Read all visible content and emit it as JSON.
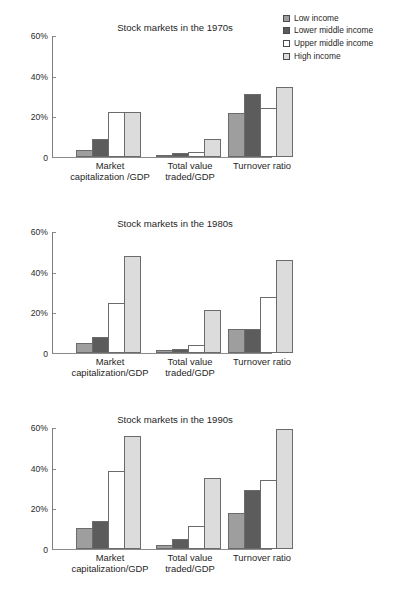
{
  "legend": {
    "position": "top-right",
    "items": [
      {
        "label": "Low income",
        "color": "#9e9e9e",
        "icon": "legend-swatch-icon"
      },
      {
        "label": "Lower middle income",
        "color": "#5c5c5c",
        "icon": "legend-swatch-icon"
      },
      {
        "label": "Upper middle income",
        "color": "#ffffff",
        "icon": "legend-swatch-icon"
      },
      {
        "label": "High income",
        "color": "#dcdcdc",
        "icon": "legend-swatch-icon"
      }
    ]
  },
  "chart_data": [
    {
      "type": "bar",
      "title": "Stock markets in the 1970s",
      "xlabel": "",
      "ylabel": "",
      "ylim": [
        0,
        60
      ],
      "yticks": [
        0,
        20,
        40,
        60
      ],
      "ytick_labels": [
        "0",
        "20%",
        "40%",
        "60%"
      ],
      "grid": false,
      "legend_position": "top-right",
      "categories": [
        "Market\ncapitalization /GDP",
        "Total value\ntraded/GDP",
        "Turnover ratio"
      ],
      "category_lines": [
        [
          "Market",
          "capitalization /GDP"
        ],
        [
          "Total value",
          "traded/GDP"
        ],
        [
          "Turnover ratio",
          ""
        ]
      ],
      "series": [
        {
          "name": "Low income",
          "values": [
            3.5,
            1.0,
            21.5
          ]
        },
        {
          "name": "Lower middle income",
          "values": [
            9.0,
            1.8,
            31.0
          ]
        },
        {
          "name": "Upper middle income",
          "values": [
            22.0,
            2.7,
            24.0
          ]
        },
        {
          "name": "High income",
          "values": [
            22.3,
            8.7,
            34.5
          ]
        }
      ]
    },
    {
      "type": "bar",
      "title": "Stock markets in the 1980s",
      "xlabel": "",
      "ylabel": "",
      "ylim": [
        0,
        60
      ],
      "yticks": [
        0,
        20,
        40,
        60
      ],
      "ytick_labels": [
        "0",
        "20%",
        "40%",
        "60%"
      ],
      "grid": false,
      "legend_position": "top-right",
      "categories": [
        "Market\ncapitalization/GDP",
        "Total value\ntraded/GDP",
        "Turnover ratio"
      ],
      "category_lines": [
        [
          "Market",
          "capitalization/GDP"
        ],
        [
          "Total value",
          "traded/GDP"
        ],
        [
          "Turnover ratio",
          ""
        ]
      ],
      "series": [
        {
          "name": "Low income",
          "values": [
            5.0,
            1.3,
            11.8
          ]
        },
        {
          "name": "Lower middle income",
          "values": [
            8.0,
            2.0,
            12.0
          ]
        },
        {
          "name": "Upper middle income",
          "values": [
            24.5,
            4.0,
            27.5
          ]
        },
        {
          "name": "High income",
          "values": [
            47.5,
            21.0,
            45.5
          ]
        }
      ]
    },
    {
      "type": "bar",
      "title": "Stock markets in the 1990s",
      "xlabel": "",
      "ylabel": "",
      "ylim": [
        0,
        60
      ],
      "yticks": [
        0,
        20,
        40,
        60
      ],
      "ytick_labels": [
        "0",
        "20%",
        "40%",
        "60%"
      ],
      "grid": false,
      "legend_position": "top-right",
      "categories": [
        "Market\ncapitalization/GDP",
        "Total value\ntraded/GDP",
        "Turnover ratio"
      ],
      "category_lines": [
        [
          "Market",
          "capitalization/GDP"
        ],
        [
          "Total value",
          "traded/GDP"
        ],
        [
          "Turnover ratio",
          ""
        ]
      ],
      "series": [
        {
          "name": "Low income",
          "values": [
            10.5,
            2.0,
            17.8
          ]
        },
        {
          "name": "Lower middle income",
          "values": [
            14.0,
            4.8,
            28.8
          ]
        },
        {
          "name": "Upper middle income",
          "values": [
            38.5,
            11.5,
            34.0
          ]
        },
        {
          "name": "High income",
          "values": [
            55.5,
            35.0,
            59.0
          ]
        }
      ]
    }
  ]
}
